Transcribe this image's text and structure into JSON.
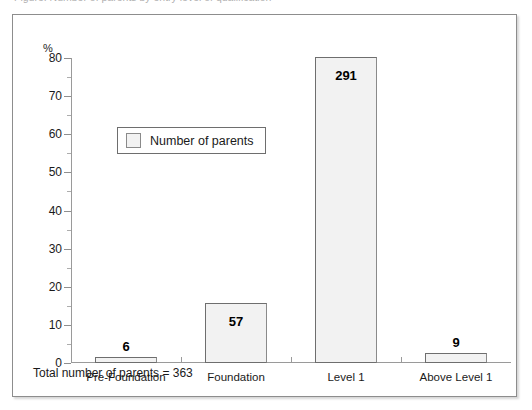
{
  "clipped_caption": "Figure: Number of parents by entry level of qualification",
  "footer": {
    "note": "Total number of parents = 363"
  },
  "legend": {
    "label": "Number of parents",
    "swatch_color": "#f2f2f2",
    "position": "inside-top-left"
  },
  "chart_data": {
    "type": "bar",
    "title": "",
    "xlabel": "",
    "ylabel": "%",
    "categories": [
      "Pre-Foundation",
      "Foundation",
      "Level 1",
      "Above Level 1"
    ],
    "values": [
      1.7,
      15.7,
      80.2,
      2.5
    ],
    "point_labels": [
      "6",
      "57",
      "291",
      "9"
    ],
    "counts": [
      6,
      57,
      291,
      9
    ],
    "total": 363,
    "ylim": [
      0,
      80
    ],
    "yticks": [
      0,
      10,
      20,
      30,
      40,
      50,
      60,
      70,
      80
    ],
    "ytick_labels": [
      "0",
      "10",
      "20",
      "30",
      "40",
      "50",
      "60",
      "70",
      "80"
    ],
    "yminor_step": 5,
    "grid": false,
    "legend_entries": [
      "Number of parents"
    ],
    "legend_position": "upper-left-inside",
    "series": [
      {
        "name": "Number of parents",
        "values": [
          1.7,
          15.7,
          80.2,
          2.5
        ],
        "labels": [
          "6",
          "57",
          "291",
          "9"
        ],
        "color": "#f2f2f2",
        "edge_color": "#6e6e6e"
      }
    ]
  }
}
